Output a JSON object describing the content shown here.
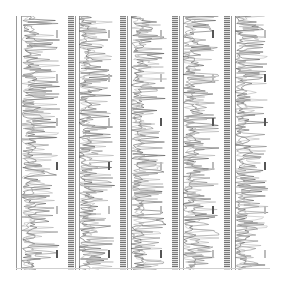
{
  "chart_data": {
    "type": "line",
    "title": "",
    "orientation": "vertical (rotated)",
    "panels": [
      {
        "index": 1,
        "tick_count": 6,
        "dark_ticks": [
          3,
          5
        ]
      },
      {
        "index": 2,
        "tick_count": 6,
        "dark_ticks": [
          3,
          5
        ]
      },
      {
        "index": 3,
        "tick_count": 6,
        "dark_ticks": [
          2,
          5
        ]
      },
      {
        "index": 4,
        "tick_count": 6,
        "dark_ticks": [
          0,
          2,
          4
        ]
      },
      {
        "index": 5,
        "tick_count": 6,
        "dark_ticks": [
          1,
          2,
          3
        ]
      }
    ],
    "xlabel": "",
    "ylabel": "",
    "grid": false,
    "legend": null,
    "colors": {
      "trace": "#555555",
      "trace_light": "#aaaaaa",
      "rail": "#999999",
      "background": "#ffffff"
    }
  }
}
